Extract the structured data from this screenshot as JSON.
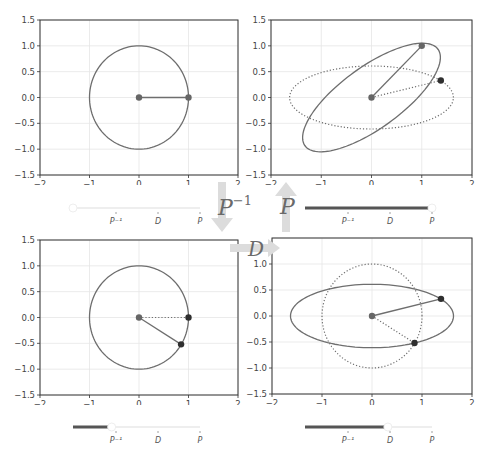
{
  "colors": {
    "curve": "#6e6e6e",
    "grid": "#e6e6e6",
    "axis": "#333333",
    "tick_label": "#444444",
    "dot_dark": "#2f2f2f",
    "dot": "#666666",
    "arrow": "#dcdcdc",
    "slider_filled": "#555555",
    "slider_empty": "#eeeeee"
  },
  "operators": {
    "p_inv": "P",
    "p_inv_sup": "−1",
    "p": "P",
    "d": "D"
  },
  "slider_labels": [
    "P⁻¹",
    "D",
    "P"
  ],
  "chart_data": [
    {
      "type": "line",
      "panel": "top-left",
      "title": "",
      "xlim": [
        -2,
        2
      ],
      "ylim": [
        -1.5,
        1.5
      ],
      "xticks": [
        "−2",
        "−1",
        "0",
        "1",
        "2"
      ],
      "yticks": [
        "1.5",
        "1.0",
        "0.5",
        "0.0",
        "−0.5",
        "−1.0",
        "−1.5"
      ],
      "grid": true,
      "series": [
        {
          "name": "unit circle",
          "style": "solid",
          "shape": "ellipse",
          "a": 1.0,
          "b": 1.0,
          "angle_deg": 0
        },
        {
          "name": "vector",
          "style": "solid",
          "from": [
            0,
            0
          ],
          "to": [
            1,
            0
          ]
        }
      ],
      "points": [
        [
          0,
          0
        ],
        [
          1,
          0
        ]
      ],
      "slider": {
        "value": 0,
        "stops": [
          "P⁻¹",
          "D",
          "P"
        ]
      }
    },
    {
      "type": "line",
      "panel": "top-right",
      "xlim": [
        -2,
        2
      ],
      "ylim": [
        -1.5,
        1.5
      ],
      "xticks": [
        "−2",
        "−1",
        "0",
        "1",
        "2"
      ],
      "yticks": [
        "1.5",
        "1.0",
        "0.5",
        "0.0",
        "−0.5",
        "−1.0",
        "−1.5"
      ],
      "grid": true,
      "series": [
        {
          "name": "previous ellipse",
          "style": "dotted",
          "shape": "ellipse",
          "a": 1.63,
          "b": 0.61,
          "angle_deg": 0
        },
        {
          "name": "transformed ellipse",
          "style": "solid",
          "shape": "ellipse",
          "a": 1.62,
          "b": 0.6,
          "angle_deg": 35
        },
        {
          "name": "previous vector",
          "style": "dotted",
          "from": [
            0,
            0
          ],
          "to": [
            1.38,
            0.33
          ]
        },
        {
          "name": "vector",
          "style": "solid",
          "from": [
            0,
            0
          ],
          "to": [
            1,
            1
          ]
        }
      ],
      "points": [
        [
          0,
          0
        ],
        [
          1,
          1
        ],
        [
          1.38,
          0.33
        ]
      ],
      "slider": {
        "value": 3,
        "stops": [
          "P⁻¹",
          "D",
          "P"
        ]
      }
    },
    {
      "type": "line",
      "panel": "bottom-left",
      "xlim": [
        -2,
        2
      ],
      "ylim": [
        -1.5,
        1.5
      ],
      "xticks": [
        "−2",
        "−1",
        "0",
        "1",
        "2"
      ],
      "yticks": [
        "1.5",
        "1.0",
        "0.5",
        "0.0",
        "−0.5",
        "−1.0",
        "−1.5"
      ],
      "grid": true,
      "series": [
        {
          "name": "unit circle",
          "style": "solid",
          "shape": "ellipse",
          "a": 1.0,
          "b": 1.0,
          "angle_deg": 0
        },
        {
          "name": "previous vector",
          "style": "dotted",
          "from": [
            0,
            0
          ],
          "to": [
            1,
            0
          ]
        },
        {
          "name": "vector",
          "style": "solid",
          "from": [
            0,
            0
          ],
          "to": [
            0.85,
            -0.52
          ]
        }
      ],
      "points": [
        [
          0,
          0
        ],
        [
          1,
          0
        ],
        [
          0.85,
          -0.52
        ]
      ],
      "slider": {
        "value": 0.9,
        "stops": [
          "P⁻¹",
          "D",
          "P"
        ]
      }
    },
    {
      "type": "line",
      "panel": "bottom-right",
      "xlim": [
        -2,
        2
      ],
      "ylim": [
        -1.5,
        1.5
      ],
      "xticks": [
        "−2",
        "−1",
        "0",
        "1",
        "2"
      ],
      "yticks": [
        "1.0",
        "0.5",
        "0.0",
        "−0.5",
        "−1.0",
        "−1.5"
      ],
      "grid": true,
      "series": [
        {
          "name": "previous circle",
          "style": "dotted",
          "shape": "ellipse",
          "a": 1.0,
          "b": 1.0,
          "angle_deg": 0
        },
        {
          "name": "scaled ellipse",
          "style": "solid",
          "shape": "ellipse",
          "a": 1.63,
          "b": 0.61,
          "angle_deg": 0
        },
        {
          "name": "previous vector",
          "style": "dotted",
          "from": [
            0,
            0
          ],
          "to": [
            0.85,
            -0.52
          ]
        },
        {
          "name": "vector",
          "style": "solid",
          "from": [
            0,
            0
          ],
          "to": [
            1.38,
            0.33
          ]
        }
      ],
      "points": [
        [
          0,
          0
        ],
        [
          0.85,
          -0.52
        ],
        [
          1.38,
          0.33
        ]
      ],
      "slider": {
        "value": 1.95,
        "stops": [
          "P⁻¹",
          "D",
          "P"
        ]
      }
    }
  ]
}
